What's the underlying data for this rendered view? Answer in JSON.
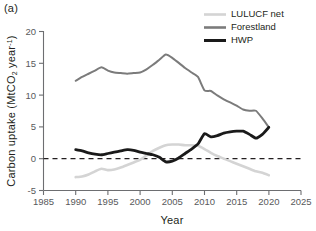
{
  "figure": {
    "panel_label": "(a)",
    "background_color": "#ffffff"
  },
  "axes": {
    "x_title": "Year",
    "y_title_main": "Carbon uptake (MtCO",
    "y_title_sub": "2",
    "y_title_mid": " year",
    "y_title_sup": "-1",
    "y_title_close": ")",
    "x_ticks": [
      "1985",
      "1990",
      "1995",
      "2000",
      "2005",
      "2010",
      "2015",
      "2020",
      "2025"
    ],
    "y_ticks": [
      "20",
      "15",
      "10",
      "5",
      "0",
      "-5"
    ],
    "zero_reference_value": "0"
  },
  "legend": {
    "position": "top-right",
    "entries": [
      {
        "label": "LULUCF net",
        "color": "#d4d4d4",
        "width": 2.6
      },
      {
        "label": "Forestland",
        "color": "#7b7b7b",
        "width": 2.6
      },
      {
        "label": "HWP",
        "color": "#1a1a1a",
        "width": 3.0
      }
    ]
  },
  "chart_data": {
    "type": "line",
    "title": "(a)",
    "xlabel": "Year",
    "ylabel": "Carbon uptake (MtCO2 year-1)",
    "xlim": [
      1985,
      2025
    ],
    "ylim": [
      -5,
      20
    ],
    "xticks": [
      1985,
      1990,
      1995,
      2000,
      2005,
      2010,
      2015,
      2020,
      2025
    ],
    "yticks": [
      -5,
      0,
      5,
      10,
      15,
      20
    ],
    "grid": false,
    "legend_position": "top-right",
    "annotations": [
      {
        "type": "hline",
        "y": 0,
        "style": "dashed",
        "color": "#231f20"
      }
    ],
    "x": [
      1990,
      1991,
      1992,
      1993,
      1994,
      1995,
      1996,
      1997,
      1998,
      1999,
      2000,
      2001,
      2002,
      2003,
      2004,
      2005,
      2006,
      2007,
      2008,
      2009,
      2010,
      2011,
      2012,
      2013,
      2014,
      2015,
      2016,
      2017,
      2018,
      2019,
      2020
    ],
    "series": [
      {
        "name": "LULUCF net",
        "color": "#d4d4d4",
        "values": [
          -2.9,
          -2.8,
          -2.5,
          -2.0,
          -1.6,
          -1.8,
          -1.7,
          -1.4,
          -1.0,
          -0.6,
          -0.2,
          0.5,
          1.2,
          1.7,
          2.1,
          2.2,
          2.2,
          2.1,
          2.1,
          2.0,
          1.5,
          0.9,
          0.4,
          0.0,
          -0.4,
          -0.8,
          -1.2,
          -1.6,
          -2.0,
          -2.2,
          -2.6
        ]
      },
      {
        "name": "Forestland",
        "color": "#7b7b7b",
        "values": [
          12.2,
          12.8,
          13.3,
          13.8,
          14.3,
          13.8,
          13.5,
          13.4,
          13.3,
          13.4,
          13.5,
          14.0,
          14.7,
          15.5,
          16.3,
          15.8,
          15.0,
          14.2,
          13.5,
          12.8,
          10.7,
          10.6,
          9.9,
          9.3,
          8.8,
          8.3,
          7.7,
          7.5,
          7.5,
          6.3,
          4.9
        ]
      },
      {
        "name": "HWP",
        "color": "#1a1a1a",
        "values": [
          1.4,
          1.2,
          0.9,
          0.7,
          0.6,
          0.8,
          1.0,
          1.2,
          1.4,
          1.3,
          1.0,
          0.8,
          0.6,
          0.2,
          -0.5,
          -0.4,
          0.1,
          0.8,
          1.5,
          2.3,
          3.9,
          3.4,
          3.6,
          4.0,
          4.2,
          4.3,
          4.3,
          3.8,
          3.2,
          3.8,
          4.9
        ]
      }
    ]
  }
}
